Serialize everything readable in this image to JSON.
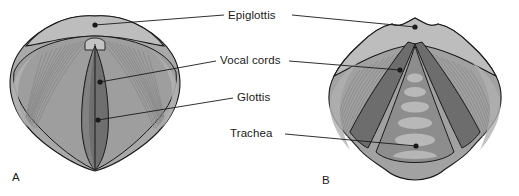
{
  "figure": {
    "style": "grayscale medical line illustration with leader-line labels"
  },
  "labels": [
    {
      "id": "epiglottis",
      "text": "Epiglottis",
      "x": 228,
      "y": 10
    },
    {
      "id": "vocal-cords",
      "text": "Vocal cords",
      "x": 220,
      "y": 55
    },
    {
      "id": "glottis",
      "text": "Glottis",
      "x": 237,
      "y": 92
    },
    {
      "id": "trachea",
      "text": "Trachea",
      "x": 230,
      "y": 128
    }
  ],
  "panels": [
    {
      "id": "a",
      "letter": "A",
      "x": 12,
      "y": 171,
      "caption": "glottis closed"
    },
    {
      "id": "b",
      "letter": "B",
      "x": 322,
      "y": 174,
      "caption": "glottis open"
    }
  ],
  "leaders": {
    "epiglottis_a": {
      "dot_x": 95,
      "dot_y": 25,
      "to_x": 224,
      "to_y": 15
    },
    "epiglottis_b": {
      "dot_x": 415,
      "dot_y": 27,
      "to_x": 292,
      "to_y": 15
    },
    "vocalcords_a": {
      "dot_x": 100,
      "dot_y": 82,
      "to_x": 216,
      "to_y": 61
    },
    "vocalcords_b": {
      "dot_x": 400,
      "dot_y": 70,
      "to_x": 289,
      "to_y": 61
    },
    "glottis_a": {
      "dot_x": 98,
      "dot_y": 120,
      "to_x": 233,
      "to_y": 98
    },
    "trachea_b": {
      "dot_x": 416,
      "dot_y": 146,
      "to_x": 285,
      "to_y": 134
    }
  },
  "colors": {
    "background": "#ffffff",
    "outline": "#1a1a1a",
    "text": "#1a1a1a",
    "epiglottis_band": "#b4b4b4",
    "wing_light": "#a8a8a8",
    "wing_mid": "#9a9a9a",
    "striation": "#8d8d8d",
    "vocal_cord_dark": "#6e6e6e",
    "glottis_slit": "#5a5a5a",
    "airway": "#8a8a8a",
    "tracheal_ring": "#b8b8b8",
    "leader_line": "#1a1a1a"
  }
}
